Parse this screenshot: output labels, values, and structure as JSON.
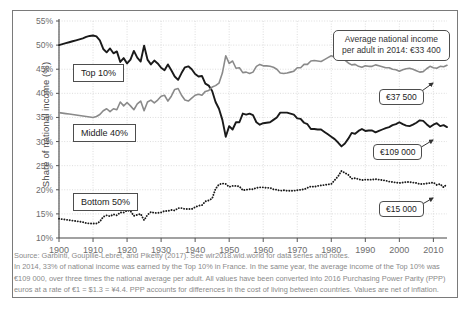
{
  "chart_data": {
    "type": "line",
    "title": "",
    "xlabel": "",
    "ylabel": "Share of national income (%)",
    "xlim": [
      1900,
      2014
    ],
    "ylim": [
      10,
      55
    ],
    "xticks": [
      "1900",
      "1910",
      "1920",
      "1930",
      "1940",
      "1950",
      "1960",
      "1970",
      "1980",
      "1990",
      "2000",
      "2010"
    ],
    "yticks": [
      "10%",
      "15%",
      "20%",
      "25%",
      "30%",
      "35%",
      "40%",
      "45%",
      "50%",
      "55%"
    ],
    "grid": true,
    "legend_position": "inline-labels",
    "series": [
      {
        "name": "Top 10%",
        "color": "#1a1a1a",
        "style": "solid",
        "x": [
          1900,
          1901,
          1902,
          1903,
          1904,
          1905,
          1906,
          1907,
          1908,
          1909,
          1910,
          1911,
          1912,
          1913,
          1914,
          1915,
          1916,
          1917,
          1918,
          1919,
          1920,
          1921,
          1922,
          1923,
          1924,
          1925,
          1926,
          1927,
          1928,
          1929,
          1930,
          1931,
          1932,
          1933,
          1934,
          1935,
          1936,
          1937,
          1938,
          1939,
          1940,
          1941,
          1942,
          1943,
          1944,
          1945,
          1946,
          1947,
          1948,
          1949,
          1950,
          1951,
          1952,
          1953,
          1954,
          1955,
          1956,
          1957,
          1958,
          1959,
          1960,
          1961,
          1962,
          1963,
          1964,
          1965,
          1966,
          1967,
          1968,
          1969,
          1970,
          1971,
          1972,
          1973,
          1974,
          1975,
          1976,
          1977,
          1978,
          1979,
          1980,
          1981,
          1982,
          1983,
          1984,
          1985,
          1986,
          1987,
          1988,
          1989,
          1990,
          1991,
          1992,
          1993,
          1994,
          1995,
          1996,
          1997,
          1998,
          1999,
          2000,
          2001,
          2002,
          2003,
          2004,
          2005,
          2006,
          2007,
          2008,
          2009,
          2010,
          2011,
          2012,
          2013,
          2014
        ],
        "values": [
          50.0,
          50.2,
          50.4,
          50.6,
          50.8,
          51.0,
          51.2,
          51.4,
          51.7,
          51.9,
          52.0,
          51.8,
          51.0,
          49.2,
          48.5,
          49.3,
          48.3,
          48.7,
          46.5,
          47.3,
          46.2,
          47.0,
          48.8,
          47.4,
          46.6,
          49.9,
          47.0,
          46.0,
          46.8,
          46.2,
          45.3,
          44.8,
          46.0,
          44.8,
          43.5,
          42.8,
          44.2,
          45.4,
          45.6,
          45.0,
          44.0,
          43.5,
          43.6,
          42.0,
          41.6,
          40.5,
          38.2,
          36.8,
          34.5,
          31.0,
          33.2,
          32.5,
          34.0,
          34.0,
          35.8,
          35.6,
          35.8,
          35.5,
          34.0,
          33.5,
          33.8,
          33.9,
          34.0,
          34.5,
          35.0,
          36.0,
          36.0,
          36.0,
          35.8,
          35.6,
          34.8,
          34.7,
          33.9,
          33.6,
          32.6,
          32.6,
          32.5,
          32.5,
          32.0,
          31.5,
          31.0,
          30.5,
          29.8,
          29.0,
          29.6,
          30.6,
          31.8,
          31.6,
          32.2,
          32.6,
          32.2,
          32.3,
          32.3,
          31.9,
          32.2,
          32.5,
          32.8,
          33.0,
          33.4,
          33.6,
          34.0,
          33.6,
          33.3,
          33.2,
          33.5,
          33.9,
          34.4,
          34.3,
          33.6,
          33.0,
          33.5,
          33.8,
          33.2,
          33.4,
          33.0
        ]
      },
      {
        "name": "Middle 40%",
        "color": "#8a8a8a",
        "style": "solid",
        "x": [
          1900,
          1901,
          1902,
          1903,
          1904,
          1905,
          1906,
          1907,
          1908,
          1909,
          1910,
          1911,
          1912,
          1913,
          1914,
          1915,
          1916,
          1917,
          1918,
          1919,
          1920,
          1921,
          1922,
          1923,
          1924,
          1925,
          1926,
          1927,
          1928,
          1929,
          1930,
          1931,
          1932,
          1933,
          1934,
          1935,
          1936,
          1937,
          1938,
          1939,
          1940,
          1941,
          1942,
          1943,
          1944,
          1945,
          1946,
          1947,
          1948,
          1949,
          1950,
          1951,
          1952,
          1953,
          1954,
          1955,
          1956,
          1957,
          1958,
          1959,
          1960,
          1961,
          1962,
          1963,
          1964,
          1965,
          1966,
          1967,
          1968,
          1969,
          1970,
          1971,
          1972,
          1973,
          1974,
          1975,
          1976,
          1977,
          1978,
          1979,
          1980,
          1981,
          1982,
          1983,
          1984,
          1985,
          1986,
          1987,
          1988,
          1989,
          1990,
          1991,
          1992,
          1993,
          1994,
          1995,
          1996,
          1997,
          1998,
          1999,
          2000,
          2001,
          2002,
          2003,
          2004,
          2005,
          2006,
          2007,
          2008,
          2009,
          2010,
          2011,
          2012,
          2013,
          2014
        ],
        "values": [
          36.0,
          35.9,
          35.8,
          35.7,
          35.6,
          35.5,
          35.4,
          35.3,
          35.2,
          35.1,
          35.0,
          35.2,
          35.6,
          36.4,
          36.8,
          36.2,
          36.8,
          36.6,
          38.2,
          37.4,
          38.1,
          37.4,
          36.6,
          37.8,
          38.4,
          36.4,
          38.2,
          38.6,
          38.0,
          38.6,
          39.4,
          39.6,
          38.4,
          39.4,
          40.8,
          41.0,
          39.6,
          38.6,
          38.4,
          39.0,
          39.6,
          39.8,
          39.6,
          40.4,
          40.6,
          41.3,
          41.6,
          42.1,
          44.2,
          47.8,
          46.2,
          46.7,
          45.2,
          45.3,
          44.3,
          44.4,
          44.1,
          44.4,
          45.6,
          46.0,
          45.7,
          45.7,
          45.6,
          45.4,
          45.0,
          44.2,
          44.1,
          44.2,
          44.4,
          44.6,
          45.3,
          45.3,
          46.0,
          46.0,
          46.7,
          46.8,
          46.7,
          46.6,
          47.0,
          47.4,
          47.8,
          47.5,
          47.4,
          47.1,
          46.9,
          46.3,
          45.9,
          46.0,
          45.6,
          45.4,
          45.7,
          45.6,
          45.6,
          45.9,
          45.7,
          45.5,
          45.3,
          45.3,
          45.0,
          44.9,
          44.6,
          44.9,
          45.1,
          45.2,
          45.0,
          44.7,
          44.4,
          44.5,
          45.1,
          45.6,
          45.3,
          45.2,
          45.6,
          45.5,
          45.8
        ]
      },
      {
        "name": "Bottom 50%",
        "color": "#1a1a1a",
        "style": "dotted",
        "x": [
          1900,
          1901,
          1902,
          1903,
          1904,
          1905,
          1906,
          1907,
          1908,
          1909,
          1910,
          1911,
          1912,
          1913,
          1914,
          1915,
          1916,
          1917,
          1918,
          1919,
          1920,
          1921,
          1922,
          1923,
          1924,
          1925,
          1926,
          1927,
          1928,
          1929,
          1930,
          1931,
          1932,
          1933,
          1934,
          1935,
          1936,
          1937,
          1938,
          1939,
          1940,
          1941,
          1942,
          1943,
          1944,
          1945,
          1946,
          1947,
          1948,
          1949,
          1950,
          1951,
          1952,
          1953,
          1954,
          1955,
          1956,
          1957,
          1958,
          1959,
          1960,
          1961,
          1962,
          1963,
          1964,
          1965,
          1966,
          1967,
          1968,
          1969,
          1970,
          1971,
          1972,
          1973,
          1974,
          1975,
          1976,
          1977,
          1978,
          1979,
          1980,
          1981,
          1982,
          1983,
          1984,
          1985,
          1986,
          1987,
          1988,
          1989,
          1990,
          1991,
          1992,
          1993,
          1994,
          1995,
          1996,
          1997,
          1998,
          1999,
          2000,
          2001,
          2002,
          2003,
          2004,
          2005,
          2006,
          2007,
          2008,
          2009,
          2010,
          2011,
          2012,
          2013,
          2014
        ],
        "values": [
          14.0,
          13.9,
          13.8,
          13.7,
          13.6,
          13.5,
          13.4,
          13.3,
          13.1,
          13.0,
          13.0,
          13.0,
          13.4,
          14.4,
          14.7,
          14.5,
          14.9,
          14.7,
          15.3,
          15.3,
          15.7,
          15.6,
          14.6,
          14.8,
          15.0,
          13.7,
          14.8,
          15.4,
          15.2,
          15.2,
          15.3,
          15.6,
          15.6,
          15.8,
          15.7,
          16.2,
          16.2,
          16.0,
          16.0,
          16.0,
          16.4,
          16.7,
          16.8,
          17.6,
          17.8,
          18.2,
          20.2,
          21.1,
          21.3,
          21.2,
          20.6,
          20.8,
          20.8,
          20.7,
          19.9,
          20.0,
          20.1,
          20.1,
          20.4,
          20.5,
          20.5,
          20.4,
          20.4,
          20.1,
          20.0,
          19.8,
          19.9,
          19.8,
          19.8,
          19.8,
          19.9,
          20.0,
          20.1,
          20.4,
          20.7,
          20.6,
          20.8,
          20.9,
          21.0,
          21.1,
          21.2,
          22.0,
          22.8,
          23.9,
          23.5,
          23.1,
          22.3,
          22.4,
          22.2,
          22.0,
          22.1,
          22.1,
          22.1,
          22.2,
          22.1,
          22.0,
          21.9,
          21.7,
          21.6,
          21.5,
          21.4,
          21.5,
          21.6,
          21.6,
          21.5,
          21.4,
          21.2,
          21.2,
          21.3,
          21.4,
          21.5,
          21.0,
          21.2,
          20.5,
          21.2
        ]
      }
    ],
    "annotations": [
      {
        "id": "avg-income",
        "text_line1": "Average national income",
        "text_line2": "per adult in 2014: €33 400"
      },
      {
        "id": "middle40-value",
        "text": "€37 500"
      },
      {
        "id": "top10-value",
        "text": "€109 000"
      },
      {
        "id": "bottom50-value",
        "text": "€15 000"
      }
    ]
  },
  "axis": {
    "y_title": "Share of national income (%)",
    "y_ticks": [
      "55%",
      "50%",
      "45%",
      "40%",
      "35%",
      "30%",
      "25%",
      "20%",
      "15%",
      "10%"
    ],
    "x_ticks": [
      "1900",
      "1910",
      "1920",
      "1930",
      "1940",
      "1950",
      "1960",
      "1970",
      "1980",
      "1990",
      "2000",
      "2010"
    ]
  },
  "series_labels": {
    "top10": "Top 10%",
    "middle40": "Middle 40%",
    "bottom50": "Bottom 50%"
  },
  "callouts": {
    "avg_line1": "Average national income",
    "avg_line2": "per adult in 2014: €33 400",
    "middle40": "€37 500",
    "top10": "€109 000",
    "bottom50": "€15 000"
  },
  "note": {
    "line1": "Source: Garbinti, Goupille-Lebret, and Piketty (2017). See wir2018.wid.world for data series and notes.",
    "line2": "In 2014, 33% of national income was earned by the Top 10% in France. In the same year, the average income of the Top 10% was",
    "line3": "€109 000, over three times the national average per adult. All values have been converted into 2016 Purchasing Power Parity (PPP)",
    "line4": "euros at a rate of €1 = $1.3 = ¥4.4. PPP accounts for differences in the cost of living between countries. Values are net of inflation."
  },
  "colors": {
    "top10": "#1a1a1a",
    "middle40": "#8a8a8a",
    "bottom50": "#1a1a1a",
    "grid": "#cfcfcf",
    "axis": "#555555",
    "note_text": "#8a8a8a"
  }
}
